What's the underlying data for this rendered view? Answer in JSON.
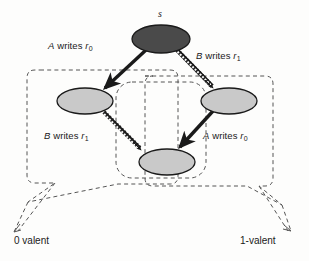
{
  "figure": {
    "background_color": "#fdfdfc",
    "nodes": [
      {
        "id": "s",
        "label": "s",
        "fill": "#4a4a4a",
        "stroke": "#1a1a1a",
        "cx": 161,
        "cy": 39,
        "rx": 29,
        "ry": 14
      },
      {
        "id": "left",
        "label": "",
        "fill": "#c9c9c9",
        "stroke": "#1a1a1a",
        "cx": 85,
        "cy": 101,
        "rx": 28,
        "ry": 13
      },
      {
        "id": "right",
        "label": "",
        "fill": "#c9c9c9",
        "stroke": "#1a1a1a",
        "cx": 229,
        "cy": 101,
        "rx": 28,
        "ry": 13
      },
      {
        "id": "bottom",
        "label": "",
        "fill": "#c9c9c9",
        "stroke": "#1a1a1a",
        "cx": 167,
        "cy": 162,
        "rx": 28,
        "ry": 13
      }
    ],
    "edges": [
      {
        "id": "s-to-left",
        "from": "s",
        "to": "left",
        "style": "solid",
        "label_id": "lbl-aw0"
      },
      {
        "id": "s-to-right",
        "from": "s",
        "to": "right",
        "style": "hatched",
        "label_id": "lbl-bw1"
      },
      {
        "id": "left-to-bottom",
        "from": "left",
        "to": "bottom",
        "style": "hatched",
        "label_id": "lbl-bw1b"
      },
      {
        "id": "right-to-bottom",
        "from": "right",
        "to": "bottom",
        "style": "solid",
        "label_id": "lbl-aw0b"
      }
    ],
    "edge_labels": {
      "s_to_left": {
        "actor": "A",
        "verb": "writes",
        "operand": "r",
        "subscript": "0"
      },
      "s_to_right": {
        "actor": "B",
        "verb": "writes",
        "operand": "r",
        "subscript": "1"
      },
      "left_to_bottom": {
        "actor": "B",
        "verb": "writes",
        "operand": "r",
        "subscript": "1"
      },
      "right_to_bottom": {
        "actor": "A",
        "verb": "writes",
        "operand": "r",
        "subscript": "0"
      }
    },
    "node_labels": {
      "start_state": "s"
    },
    "regions": [
      {
        "id": "zero-valent-region",
        "callout_label": "0 valent",
        "style": "dashed-rounded-bubble"
      },
      {
        "id": "one-valent-region",
        "callout_label": "1-valent",
        "style": "dashed-rounded-bubble"
      },
      {
        "id": "middle-region",
        "callout_label": "",
        "style": "dashed-rounded-box"
      }
    ],
    "callouts": {
      "zero_valent": "0 valent",
      "one_valent": "1-valent"
    },
    "colors": {
      "dark_node": "#4a4a4a",
      "light_node": "#c9c9c9",
      "outline": "#1a1a1a",
      "dashed": "#555555",
      "text": "#1a1a1a"
    }
  }
}
